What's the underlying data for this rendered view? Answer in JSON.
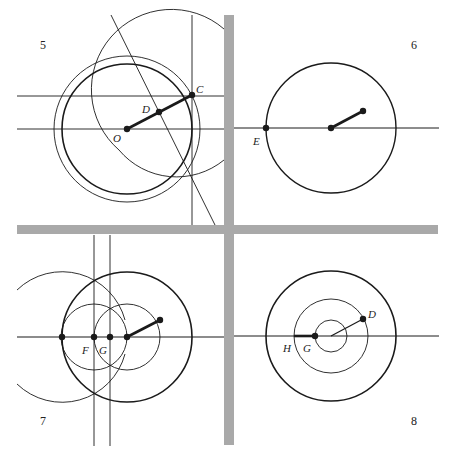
{
  "figure": {
    "caption_fragment": "",
    "divider_color": "#a9a9a9",
    "ink_color": "#1a1a1a",
    "panels": [
      {
        "number": "5",
        "labels": {
          "O": "O",
          "D": "D",
          "C": "C"
        }
      },
      {
        "number": "6",
        "labels": {
          "E": "E"
        }
      },
      {
        "number": "7",
        "labels": {
          "F": "F",
          "G": "G"
        }
      },
      {
        "number": "8",
        "labels": {
          "H": "H",
          "G": "G",
          "D": "D"
        }
      }
    ]
  }
}
